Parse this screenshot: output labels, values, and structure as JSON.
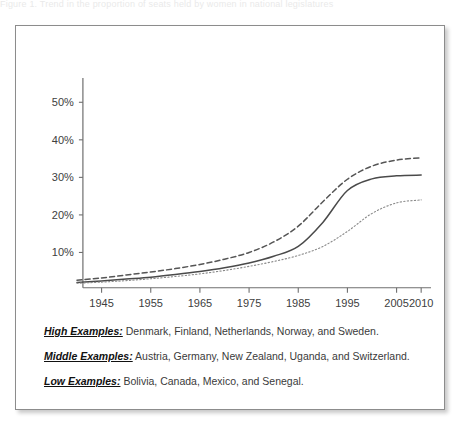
{
  "top_caption": "Figure   1.   Trend   in   the   proportion   of   seats   held   by   women   in   national   legislatures",
  "legend": {
    "rows": [
      {
        "key": "High Examples:",
        "value": "Denmark, Finland, Netherlands, Norway, and Sweden."
      },
      {
        "key": "Middle Examples:",
        "value": "Austria, Germany, New Zealand, Uganda, and Switzerland."
      },
      {
        "key": "Low Examples:",
        "value": "Bolivia, Canada, Mexico, and Senegal."
      }
    ]
  },
  "chart_data": {
    "type": "line",
    "title": "",
    "xlabel": "",
    "ylabel": "",
    "xlim": [
      1940,
      2012
    ],
    "ylim": [
      0,
      57
    ],
    "grid": false,
    "legend_position": "below-plot",
    "x_ticks": [
      1945,
      1955,
      1965,
      1975,
      1985,
      1995,
      2005,
      2010
    ],
    "x_tick_labels": [
      "1945",
      "1955",
      "1965",
      "1975",
      "1985",
      "1995",
      "2005",
      "2010"
    ],
    "y_ticks": [
      10,
      20,
      30,
      40,
      50
    ],
    "y_tick_labels": [
      "10%",
      "20%",
      "30%",
      "40%",
      "50%"
    ],
    "x": [
      1940,
      1945,
      1950,
      1955,
      1960,
      1965,
      1970,
      1975,
      1980,
      1985,
      1990,
      1995,
      2000,
      2005,
      2010
    ],
    "series": [
      {
        "name": "High Examples",
        "style": "dashed",
        "color": "#555555",
        "values": [
          2.6,
          3.2,
          4.0,
          4.8,
          5.7,
          6.8,
          8.2,
          10.0,
          12.8,
          17.0,
          23.5,
          29.5,
          33.0,
          34.6,
          35.2
        ]
      },
      {
        "name": "Middle Examples",
        "style": "solid",
        "color": "#4a4a4a",
        "values": [
          2.0,
          2.4,
          2.9,
          3.4,
          4.1,
          4.9,
          5.9,
          7.2,
          9.0,
          11.6,
          18.0,
          26.5,
          29.6,
          30.4,
          30.6
        ]
      },
      {
        "name": "Low Examples",
        "style": "dotted",
        "color": "#8a8a8a",
        "values": [
          1.8,
          2.1,
          2.5,
          3.0,
          3.6,
          4.3,
          5.2,
          6.3,
          7.6,
          9.2,
          11.6,
          15.6,
          20.4,
          23.2,
          24.0
        ]
      }
    ]
  }
}
